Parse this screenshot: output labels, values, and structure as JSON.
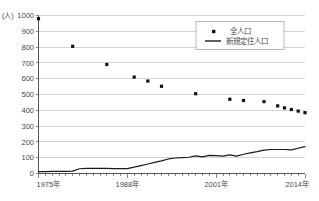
{
  "chart_data": {
    "type": "scatter",
    "title": "",
    "xlabel": "",
    "ylabel": "(人)",
    "ylim": [
      0,
      1000
    ],
    "ytick_labels": [
      "0",
      "100",
      "200",
      "300",
      "400",
      "500",
      "600",
      "700",
      "800",
      "900",
      "1000"
    ],
    "ytick_values": [
      0,
      100,
      200,
      300,
      400,
      500,
      600,
      700,
      800,
      900,
      1000
    ],
    "xlim": [
      1975,
      2014
    ],
    "xtick_labels": [
      "1975年",
      "1988年",
      "2001年",
      "2014年"
    ],
    "xtick_values": [
      1975,
      1988,
      2001,
      2014
    ],
    "grid": true,
    "legend_position": "upper-right",
    "series": [
      {
        "name": "全人口",
        "marker": "square",
        "style": "scatter",
        "points": [
          [
            1975,
            980
          ],
          [
            1980,
            805
          ],
          [
            1985,
            690
          ],
          [
            1989,
            610
          ],
          [
            1991,
            585
          ],
          [
            1993,
            552
          ],
          [
            1998,
            505
          ],
          [
            2003,
            470
          ],
          [
            2005,
            462
          ],
          [
            2008,
            455
          ],
          [
            2010,
            428
          ],
          [
            2011,
            415
          ],
          [
            2012,
            405
          ],
          [
            2013,
            395
          ],
          [
            2014,
            385
          ]
        ]
      },
      {
        "name": "新規定住人口",
        "marker": "none",
        "style": "line",
        "points": [
          [
            1975,
            12
          ],
          [
            1976,
            12
          ],
          [
            1977,
            13
          ],
          [
            1978,
            13
          ],
          [
            1979,
            14
          ],
          [
            1980,
            15
          ],
          [
            1981,
            30
          ],
          [
            1982,
            33
          ],
          [
            1983,
            33
          ],
          [
            1984,
            33
          ],
          [
            1985,
            32
          ],
          [
            1986,
            31
          ],
          [
            1987,
            31
          ],
          [
            1988,
            31
          ],
          [
            1989,
            40
          ],
          [
            1990,
            50
          ],
          [
            1991,
            60
          ],
          [
            1992,
            70
          ],
          [
            1993,
            80
          ],
          [
            1994,
            92
          ],
          [
            1995,
            98
          ],
          [
            1996,
            100
          ],
          [
            1997,
            103
          ],
          [
            1998,
            112
          ],
          [
            1999,
            105
          ],
          [
            2000,
            115
          ],
          [
            2001,
            113
          ],
          [
            2002,
            110
          ],
          [
            2003,
            118
          ],
          [
            2004,
            110
          ],
          [
            2005,
            122
          ],
          [
            2006,
            130
          ],
          [
            2007,
            138
          ],
          [
            2008,
            148
          ],
          [
            2009,
            152
          ],
          [
            2010,
            152
          ],
          [
            2011,
            152
          ],
          [
            2012,
            150
          ],
          [
            2013,
            160
          ],
          [
            2014,
            170
          ]
        ]
      }
    ]
  }
}
